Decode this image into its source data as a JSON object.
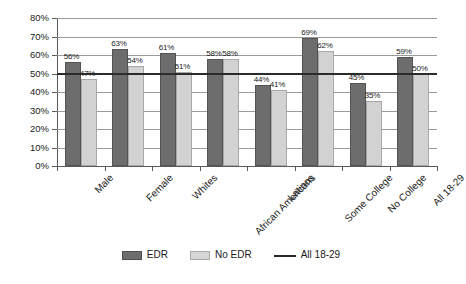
{
  "chart_data": {
    "type": "bar",
    "title": "",
    "subtitle": "",
    "xlabel": "",
    "ylabel": "",
    "ylim": [
      0,
      80
    ],
    "ytick_step": 10,
    "grid": true,
    "legend_position": "bottom",
    "categories": [
      "Male",
      "Female",
      "Whites",
      "African Americans",
      "Latinos",
      "Some College",
      "No College",
      "All 18-29"
    ],
    "series": [
      {
        "name": "EDR",
        "color": "#6d6d6d",
        "values": [
          56,
          63,
          61,
          58,
          44,
          69,
          45,
          59
        ],
        "labels": [
          "56%",
          "63%",
          "61%",
          "58%",
          "44%",
          "69%",
          "45%",
          "59%"
        ]
      },
      {
        "name": "No EDR",
        "color": "#d2d2d2",
        "values": [
          47,
          54,
          51,
          58,
          41,
          62,
          35,
          50
        ],
        "labels": [
          "47%",
          "54%",
          "51%",
          "58%",
          "41%",
          "62%",
          "35%",
          "50%"
        ]
      }
    ],
    "reference_line": {
      "name": "All 18-29",
      "value": 50,
      "label": "All 18-29",
      "color": "#2b2b2b"
    },
    "ytick_labels": [
      "0%",
      "10%",
      "20%",
      "30%",
      "40%",
      "50%",
      "60%",
      "70%",
      "80%"
    ],
    "ytick_values": [
      0,
      10,
      20,
      30,
      40,
      50,
      60,
      70,
      80
    ],
    "legend": [
      {
        "label": "EDR",
        "swatch": "dark-square"
      },
      {
        "label": "No EDR",
        "swatch": "light-square"
      },
      {
        "label": "All 18-29",
        "swatch": "dark-line"
      }
    ]
  }
}
